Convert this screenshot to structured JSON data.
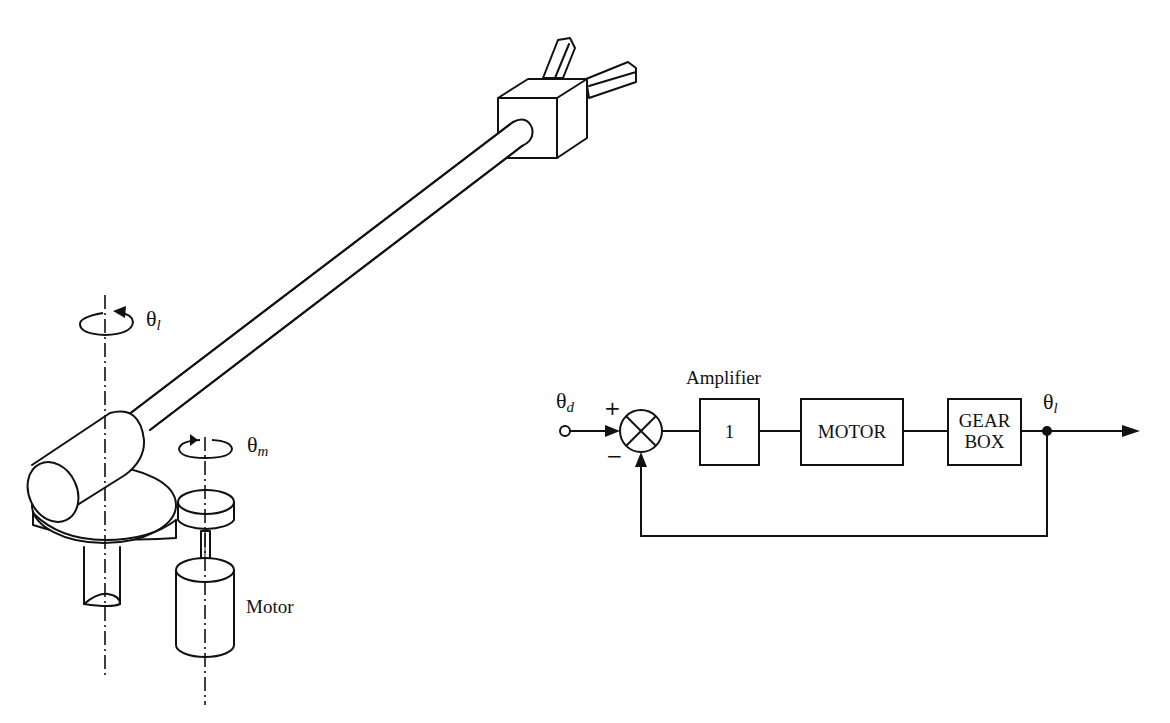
{
  "figure": {
    "left_panel": {
      "title": "Single-link robot arm driven by motor through gears",
      "labels": {
        "load_angle": {
          "symbol": "θ",
          "subscript": "l"
        },
        "motor_angle": {
          "symbol": "θ",
          "subscript": "m"
        },
        "motor": "Motor"
      }
    },
    "right_panel": {
      "title": "Closed-loop block diagram",
      "input": {
        "symbol": "θ",
        "subscript": "d"
      },
      "output": {
        "symbol": "θ",
        "subscript": "l"
      },
      "summing_junction": {
        "plus": "+",
        "minus": "−"
      },
      "amplifier_label": "Amplifier",
      "blocks": [
        {
          "id": "amplifier",
          "line1": "1",
          "line2": ""
        },
        {
          "id": "motor",
          "line1": "MOTOR",
          "line2": ""
        },
        {
          "id": "gearbox",
          "line1": "GEAR",
          "line2": "BOX"
        }
      ]
    },
    "colors": {
      "ink": "#111111",
      "background": "#ffffff"
    }
  }
}
